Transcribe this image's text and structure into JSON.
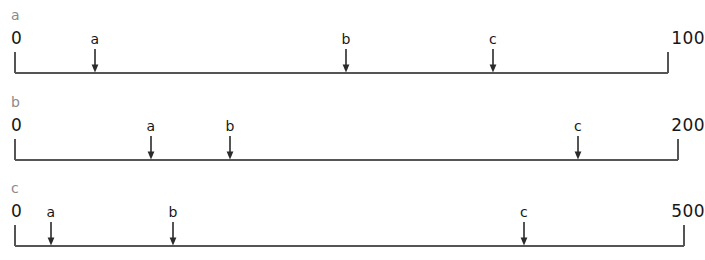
{
  "figure": {
    "title": "",
    "line_color": "#555555",
    "label_color": "#171717",
    "panel_label_color": "#8a8a8a",
    "background": "#ffffff"
  },
  "chart_data": {
    "type": "scatter",
    "title": "",
    "xlabel": "",
    "ylabel": "",
    "grid": false,
    "legend": "none",
    "panels": [
      {
        "panel_label": "a",
        "start_label": "0",
        "end_label": "100",
        "xmin": 0,
        "xmax": 100,
        "markers": [
          {
            "label": "a",
            "value": 12
          },
          {
            "label": "b",
            "value": 51
          },
          {
            "label": "c",
            "value": 73
          }
        ]
      },
      {
        "panel_label": "b",
        "start_label": "0",
        "end_label": "200",
        "xmin": 0,
        "xmax": 200,
        "markers": [
          {
            "label": "a",
            "value": 41
          },
          {
            "label": "b",
            "value": 65
          },
          {
            "label": "c",
            "value": 170
          }
        ]
      },
      {
        "panel_label": "c",
        "start_label": "0",
        "end_label": "500",
        "xmin": 0,
        "xmax": 500,
        "markers": [
          {
            "label": "a",
            "value": 27
          },
          {
            "label": "b",
            "value": 118
          },
          {
            "label": "c",
            "value": 381
          }
        ]
      }
    ]
  },
  "layout": {
    "panels": [
      {
        "top": 0,
        "panel_label_top": 8,
        "axis_left": 15,
        "axis_right": 668,
        "baseline_y": 73,
        "tick_top": 52,
        "end_label_top": 30,
        "left_label_x": 11,
        "right_label_x": 705,
        "marker_label_top": 32,
        "arrow_top": 49,
        "markers_x": [
          95,
          346,
          493
        ]
      },
      {
        "top": 87,
        "panel_label_top": 95,
        "axis_left": 15,
        "axis_right": 678,
        "baseline_y": 160,
        "tick_top": 139,
        "end_label_top": 117,
        "left_label_x": 11,
        "right_label_x": 705,
        "marker_label_top": 119,
        "arrow_top": 136,
        "markers_x": [
          151,
          230,
          578
        ]
      },
      {
        "top": 173,
        "panel_label_top": 181,
        "axis_left": 15,
        "axis_right": 684,
        "baseline_y": 246,
        "tick_top": 225,
        "end_label_top": 203,
        "left_label_x": 11,
        "right_label_x": 705,
        "marker_label_top": 205,
        "arrow_top": 222,
        "markers_x": [
          51,
          173,
          524
        ]
      }
    ]
  }
}
